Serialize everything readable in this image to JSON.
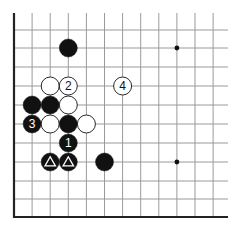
{
  "diagram": {
    "type": "go-board-corner",
    "grid": {
      "origin_x": 14,
      "bottom_y": 217,
      "col_spacing": 18.1,
      "row_ys": [
        30,
        48,
        67,
        86,
        105,
        124,
        143,
        162,
        181,
        199,
        217
      ],
      "top_y": 13,
      "right_x": 228,
      "columns": 12,
      "line_color": "#9a9a9a",
      "edge_color": "#222222"
    },
    "star_points": [
      {
        "col": 9,
        "row": 1
      },
      {
        "col": 9,
        "row": 7
      }
    ],
    "stones": [
      {
        "color": "black",
        "col": 3,
        "row": 1,
        "label": "",
        "mark": ""
      },
      {
        "color": "white",
        "col": 2,
        "row": 3,
        "label": "",
        "mark": ""
      },
      {
        "color": "white",
        "col": 3,
        "row": 3,
        "label": "2",
        "mark": ""
      },
      {
        "color": "white",
        "col": 6,
        "row": 3,
        "label": "4",
        "mark": ""
      },
      {
        "color": "black",
        "col": 1,
        "row": 4,
        "label": "",
        "mark": ""
      },
      {
        "color": "black",
        "col": 2,
        "row": 4,
        "label": "",
        "mark": ""
      },
      {
        "color": "white",
        "col": 3,
        "row": 4,
        "label": "",
        "mark": ""
      },
      {
        "color": "black",
        "col": 1,
        "row": 5,
        "label": "3",
        "mark": ""
      },
      {
        "color": "white",
        "col": 2,
        "row": 5,
        "label": "",
        "mark": ""
      },
      {
        "color": "black",
        "col": 3,
        "row": 5,
        "label": "",
        "mark": ""
      },
      {
        "color": "white",
        "col": 4,
        "row": 5,
        "label": "",
        "mark": ""
      },
      {
        "color": "black",
        "col": 3,
        "row": 6,
        "label": "1",
        "mark": ""
      },
      {
        "color": "black",
        "col": 2,
        "row": 7,
        "label": "",
        "mark": "triangle"
      },
      {
        "color": "black",
        "col": 3,
        "row": 7,
        "label": "",
        "mark": "triangle"
      },
      {
        "color": "black",
        "col": 5,
        "row": 7,
        "label": "",
        "mark": ""
      }
    ],
    "stone_radius": 9
  }
}
